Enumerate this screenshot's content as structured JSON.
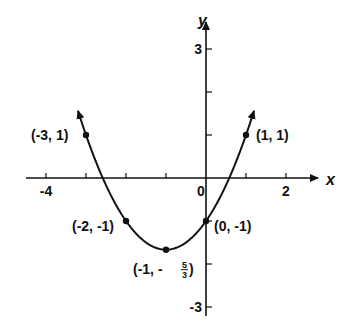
{
  "chart_data": {
    "type": "line",
    "title": "",
    "xlabel": "x",
    "ylabel": "y",
    "xlim": [
      -4.5,
      3
    ],
    "ylim": [
      -3.3,
      3.6
    ],
    "grid": false,
    "x_ticks": [
      -4,
      -3,
      -2,
      -1,
      0,
      1,
      2
    ],
    "x_tick_labels": [
      {
        "value": -4,
        "label": "-4"
      },
      {
        "value": 0,
        "label": "0"
      },
      {
        "value": 2,
        "label": "2"
      }
    ],
    "y_ticks": [
      -3,
      -2,
      -1,
      1,
      2,
      3
    ],
    "y_tick_labels": [
      {
        "value": 3,
        "label": "3"
      },
      {
        "value": -3,
        "label": "-3"
      }
    ],
    "series": [
      {
        "name": "parabola",
        "equation": "y = (2/3)(x+1)^2 - 5/3",
        "x": [
          -3.15,
          -3,
          -2,
          -1,
          0,
          1,
          1.15
        ],
        "y": [
          1.42,
          1,
          -1,
          -1.667,
          -1,
          1,
          1.42
        ],
        "arrows_both_ends": true
      }
    ],
    "points": [
      {
        "x": -3,
        "y": 1,
        "label": "(-3, 1)"
      },
      {
        "x": -2,
        "y": -1,
        "label": "(-2, -1)"
      },
      {
        "x": -1,
        "y": -1.667,
        "label_prefix": "(-1, -",
        "label_num": "5",
        "label_den": "3",
        "label_suffix": ")"
      },
      {
        "x": 0,
        "y": -1,
        "label": "(0, -1)"
      },
      {
        "x": 1,
        "y": 1,
        "label": "(1, 1)"
      }
    ]
  }
}
